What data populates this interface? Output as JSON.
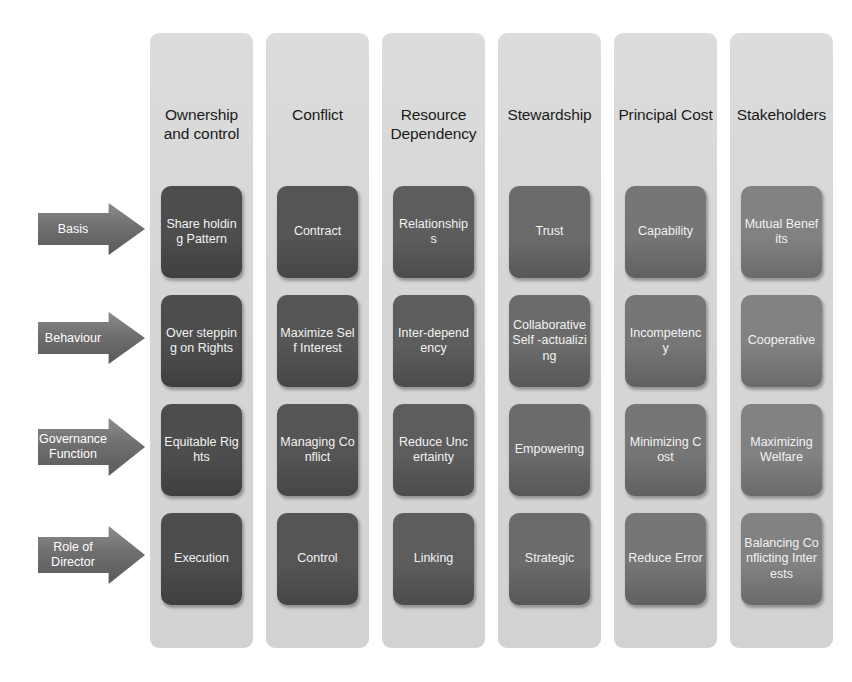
{
  "diagram": {
    "colors": {
      "band_background": "#d6d6d6",
      "arrow_fill": "#6f6f6f",
      "box_text": "#f2f2f2",
      "header_text": "#1a1a1a",
      "page_background": "#ffffff"
    },
    "row_labels": [
      {
        "label": "Basis"
      },
      {
        "label": "Behaviour"
      },
      {
        "label": "Governance Function"
      },
      {
        "label": "Role of Director"
      }
    ],
    "columns": [
      {
        "header": "Ownership and control",
        "box_color": "#4d4d4d",
        "cells": [
          "Share holding Pattern",
          "Over stepping on Rights",
          "Equitable Rights",
          "Execution"
        ]
      },
      {
        "header": "Conflict",
        "box_color": "#555555",
        "cells": [
          "Contract",
          "Maximize Self Interest",
          "Managing Conflict",
          "Control"
        ]
      },
      {
        "header": "Resource Dependency",
        "box_color": "#5d5d5d",
        "cells": [
          "Relationships",
          "Inter-dependency",
          "Reduce Uncertainty",
          "Linking"
        ]
      },
      {
        "header": "Stewardship",
        "box_color": "#6b6b6b",
        "cells": [
          "Trust",
          "Collaborative Self -actualizing",
          "Empowering",
          "Strategic"
        ]
      },
      {
        "header": "Principal Cost",
        "box_color": "#767676",
        "cells": [
          "Capability",
          "Incompetency",
          "Minimizing Cost",
          "Reduce Error"
        ]
      },
      {
        "header": "Stakeholders",
        "box_color": "#828282",
        "cells": [
          "Mutual Benefits",
          "Cooperative",
          "Maximizing Welfare",
          "Balancing Conflicting Interests"
        ]
      }
    ]
  }
}
